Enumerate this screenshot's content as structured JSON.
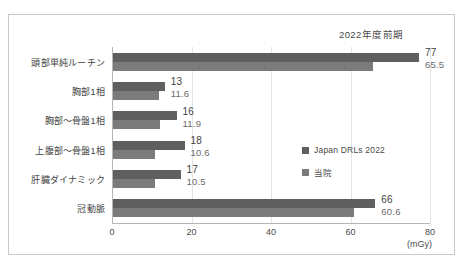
{
  "chart_data": {
    "type": "bar",
    "orientation": "horizontal",
    "title": "2022年度前期",
    "xlabel": "(mGy)",
    "ylabel": "",
    "xlim": [
      0,
      80
    ],
    "xticks": [
      0,
      20,
      40,
      60,
      80
    ],
    "grid": true,
    "legend_position": "middle-right-inside",
    "categories": [
      "頭部単純ルーチン",
      "胸部1相",
      "胸部〜骨盤1相",
      "上腹部〜骨盤1相",
      "肝臓ダイナミック",
      "冠動脈"
    ],
    "series": [
      {
        "name": "Japan DRLs 2022",
        "color": "#5f5f5f",
        "values": [
          77,
          13,
          16,
          18,
          17,
          66
        ],
        "labels": [
          "77",
          "13",
          "16",
          "18",
          "17",
          "66"
        ]
      },
      {
        "name": "当院",
        "color": "#7b7b7b",
        "values": [
          65.5,
          11.6,
          11.9,
          10.6,
          10.5,
          60.6
        ],
        "labels": [
          "65.5",
          "11.6",
          "11.9",
          "10.6",
          "10.5",
          "60.6"
        ]
      }
    ]
  },
  "axis": {
    "unit": "(mGy)",
    "tick_labels": [
      "0",
      "20",
      "40",
      "60",
      "80"
    ]
  },
  "legend": {
    "items": [
      {
        "label": "Japan DRLs 2022"
      },
      {
        "label": "当院"
      }
    ]
  }
}
